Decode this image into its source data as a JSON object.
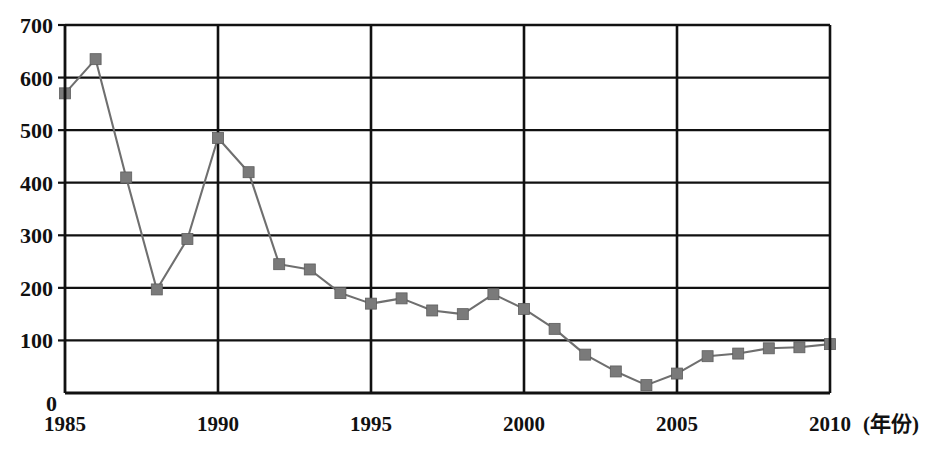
{
  "chart_data": {
    "type": "line",
    "title": "",
    "xlabel": "(年份)",
    "ylabel": "",
    "x": [
      1985,
      1986,
      1987,
      1988,
      1989,
      1990,
      1991,
      1992,
      1993,
      1994,
      1995,
      1996,
      1997,
      1998,
      1999,
      2000,
      2001,
      2002,
      2003,
      2004,
      2005,
      2006,
      2007,
      2008,
      2009,
      2010
    ],
    "values": [
      570,
      635,
      410,
      197,
      293,
      485,
      420,
      245,
      235,
      190,
      170,
      180,
      157,
      150,
      188,
      160,
      122,
      73,
      41,
      15,
      37,
      70,
      75,
      85,
      87,
      93
    ],
    "series": [
      {
        "name": "series-1",
        "values": [
          570,
          635,
          410,
          197,
          293,
          485,
          420,
          245,
          235,
          190,
          170,
          180,
          157,
          150,
          188,
          160,
          122,
          73,
          41,
          15,
          37,
          70,
          75,
          85,
          87,
          93
        ]
      }
    ],
    "xlim": [
      1985,
      2010
    ],
    "ylim": [
      0,
      700
    ],
    "ytick_labels": [
      "0",
      "100",
      "200",
      "300",
      "400",
      "500",
      "600",
      "700"
    ],
    "ytick_values": [
      0,
      100,
      200,
      300,
      400,
      500,
      600,
      700
    ],
    "xtick_labels": [
      "1985",
      "1990",
      "1995",
      "2000",
      "2005",
      "2010"
    ],
    "xtick_values": [
      1985,
      1990,
      1995,
      2000,
      2005,
      2010
    ],
    "grid": "horizontal-and-vertical",
    "legend": "none",
    "marker": "square",
    "colors": {
      "line": "#6f6f6f",
      "marker": "#7a7a7a",
      "axis": "#111111",
      "grid": "#111111",
      "background": "#ffffff"
    }
  },
  "zero_origin_label": "0"
}
